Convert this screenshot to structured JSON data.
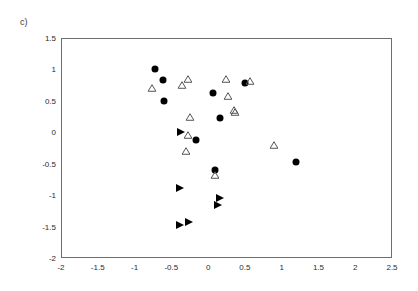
{
  "figure": {
    "panel_label": "c)",
    "background_color": "#ffffff",
    "frame_color": "#6e6e6e"
  },
  "chart_data": {
    "type": "scatter",
    "title": "c)",
    "xlabel": "",
    "ylabel": "",
    "xlim": [
      -2,
      2.5
    ],
    "ylim": [
      -2,
      1.5
    ],
    "grid": false,
    "legend": null,
    "xticks": [
      -2,
      -1.5,
      -1,
      -0.5,
      0,
      0.5,
      1,
      1.5,
      2,
      2.5
    ],
    "xticklabels": [
      "-2",
      "-1.5",
      "-1",
      "-0.5",
      "0",
      "0.5",
      "1",
      "1.5",
      "2",
      "2.5"
    ],
    "yticks": [
      1.5,
      1,
      0.5,
      0,
      -0.5,
      -1,
      -1.5,
      -2
    ],
    "yticklabels": [
      "1.5",
      "1",
      "0.5",
      "0",
      "-0.5",
      "-1",
      "-1.5",
      "-2"
    ],
    "series": [
      {
        "name": "filled-circle",
        "marker": "circle",
        "fill": "#000000",
        "edge": "#000000",
        "size": 7,
        "points": [
          [
            -0.72,
            1.01
          ],
          [
            -0.61,
            0.83
          ],
          [
            -0.6,
            0.49
          ],
          [
            0.07,
            0.62
          ],
          [
            0.16,
            0.23
          ],
          [
            0.5,
            0.79
          ],
          [
            -0.17,
            -0.13
          ],
          [
            0.09,
            -0.6
          ],
          [
            1.19,
            -0.48
          ]
        ]
      },
      {
        "name": "open-triangle-up",
        "marker": "triangle-up-open",
        "fill": "none",
        "edge": "#555555",
        "size": 8,
        "points": [
          [
            -0.76,
            0.7
          ],
          [
            -0.35,
            0.75
          ],
          [
            -0.27,
            0.85
          ],
          [
            0.24,
            0.85
          ],
          [
            0.57,
            0.81
          ],
          [
            0.27,
            0.58
          ],
          [
            -0.25,
            0.24
          ],
          [
            0.35,
            0.36
          ],
          [
            0.37,
            0.33
          ],
          [
            -0.27,
            -0.04
          ],
          [
            -0.3,
            -0.3
          ],
          [
            0.9,
            -0.21
          ],
          [
            0.09,
            -0.68
          ]
        ]
      },
      {
        "name": "filled-triangle-right",
        "marker": "triangle-right-filled",
        "fill": "#000000",
        "edge": "#000000",
        "size": 8,
        "points": [
          [
            -0.37,
            0.0
          ],
          [
            -0.38,
            -0.89
          ],
          [
            0.16,
            -1.04
          ],
          [
            0.13,
            -1.15
          ],
          [
            -0.38,
            -1.47
          ],
          [
            -0.26,
            -1.42
          ]
        ]
      }
    ]
  }
}
